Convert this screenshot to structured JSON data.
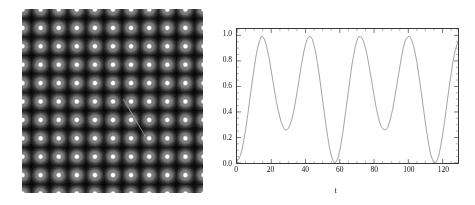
{
  "figure": {
    "panels": [
      "lattice-image",
      "oscillation-plot"
    ]
  },
  "left_panel": {
    "name": "lattice-intensity-map",
    "description": "grayscale periodic lattice of bright spots on black background",
    "background_color": "#050505",
    "spot_color": "#ffffff",
    "annotation_line_color": "#9a9a9a",
    "columns": 10,
    "rows": 10,
    "annotation": {
      "x1_pct": 56,
      "y1_pct": 49,
      "x2_pct": 68,
      "y2_pct": 69
    }
  },
  "chart_data": {
    "type": "line",
    "title": "",
    "xlabel": "t",
    "ylabel": "E[t(cosω,sinω),0)]",
    "ylabel_superscript": "T",
    "xlim": [
      0,
      129
    ],
    "ylim": [
      0.0,
      1.05
    ],
    "xticks": [
      0,
      20,
      40,
      60,
      80,
      100,
      120
    ],
    "xtick_labels": [
      "0",
      "20",
      "40",
      "60",
      "80",
      "100",
      "120"
    ],
    "yticks": [
      0.0,
      0.2,
      0.4,
      0.6,
      0.8,
      1.0
    ],
    "ytick_labels": [
      "0.0",
      "0.2",
      "0.4",
      "0.6",
      "0.8",
      "1.0"
    ],
    "grid": false,
    "legend": null,
    "line_color": "#8a8a8a",
    "line_width": 0.8,
    "series": [
      {
        "name": "E[t(cos w,sin w),0)]^T",
        "x": [
          0,
          1,
          2,
          3,
          4,
          5,
          6,
          7,
          8,
          9,
          10,
          11,
          12,
          13,
          14,
          15,
          16,
          17,
          18,
          19,
          20,
          21,
          22,
          23,
          24,
          25,
          26,
          27,
          28,
          29,
          30,
          31,
          32,
          33,
          34,
          35,
          36,
          37,
          38,
          39,
          40,
          41,
          42,
          43,
          44,
          45,
          46,
          47,
          48,
          49,
          50,
          51,
          52,
          53,
          54,
          55,
          56,
          57,
          58,
          59,
          60,
          61,
          62,
          63,
          64,
          65,
          66,
          67,
          68,
          69,
          70,
          71,
          72,
          73,
          74,
          75,
          76,
          77,
          78,
          79,
          80,
          81,
          82,
          83,
          84,
          85,
          86,
          87,
          88,
          89,
          90,
          91,
          92,
          93,
          94,
          95,
          96,
          97,
          98,
          99,
          100,
          101,
          102,
          103,
          104,
          105,
          106,
          107,
          108,
          109,
          110,
          111,
          112,
          113,
          114,
          115,
          116,
          117,
          118,
          119,
          120,
          121,
          122,
          123,
          124,
          125,
          126,
          127,
          128,
          129
        ],
        "y": [
          0.02,
          0.03,
          0.06,
          0.11,
          0.18,
          0.26,
          0.35,
          0.45,
          0.55,
          0.65,
          0.74,
          0.83,
          0.9,
          0.95,
          0.99,
          0.99,
          0.97,
          0.93,
          0.87,
          0.8,
          0.72,
          0.64,
          0.56,
          0.48,
          0.42,
          0.36,
          0.31,
          0.28,
          0.26,
          0.26,
          0.27,
          0.3,
          0.34,
          0.4,
          0.47,
          0.55,
          0.63,
          0.72,
          0.8,
          0.87,
          0.93,
          0.97,
          0.99,
          0.99,
          0.97,
          0.92,
          0.86,
          0.78,
          0.69,
          0.59,
          0.49,
          0.39,
          0.29,
          0.2,
          0.12,
          0.06,
          0.02,
          0.0,
          0.01,
          0.04,
          0.1,
          0.17,
          0.26,
          0.36,
          0.46,
          0.56,
          0.66,
          0.76,
          0.84,
          0.91,
          0.96,
          0.99,
          0.99,
          0.98,
          0.95,
          0.9,
          0.84,
          0.77,
          0.69,
          0.61,
          0.53,
          0.45,
          0.39,
          0.33,
          0.29,
          0.27,
          0.26,
          0.26,
          0.28,
          0.32,
          0.37,
          0.43,
          0.51,
          0.59,
          0.67,
          0.75,
          0.83,
          0.9,
          0.95,
          0.98,
          0.99,
          0.99,
          0.96,
          0.92,
          0.86,
          0.79,
          0.7,
          0.61,
          0.51,
          0.41,
          0.31,
          0.22,
          0.14,
          0.07,
          0.03,
          0.0,
          0.0,
          0.03,
          0.07,
          0.14,
          0.22,
          0.31,
          0.41,
          0.51,
          0.61,
          0.7,
          0.79,
          0.86,
          0.91,
          0.95
        ]
      }
    ],
    "peaks": [
      {
        "t": 14,
        "value": 0.99
      },
      {
        "t": 43,
        "value": 0.99
      },
      {
        "t": 72,
        "value": 0.99
      },
      {
        "t": 101,
        "value": 0.99
      }
    ],
    "minima": [
      {
        "t": 29,
        "value": 0.26
      },
      {
        "t": 57,
        "value": 0.0
      },
      {
        "t": 87,
        "value": 0.26
      },
      {
        "t": 115,
        "value": 0.0
      }
    ]
  }
}
